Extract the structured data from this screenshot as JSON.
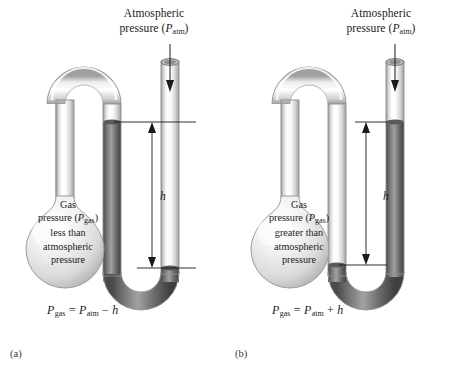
{
  "figure": {
    "background_color": "#ffffff",
    "mercury_color": "#6f6f6f",
    "glass_color": "#d8d8d8",
    "line_color": "#1a1a1a"
  },
  "panels": [
    {
      "caption": "(a)",
      "atmospheric": {
        "line1": "Atmospheric",
        "line2_prefix": "pressure (",
        "line2_symbol": "P",
        "line2_subscript": "atm",
        "line2_suffix": ")"
      },
      "bulb": {
        "line1": "Gas",
        "line2_prefix": "pressure (",
        "line2_symbol": "P",
        "line2_subscript": "gas",
        "line2_suffix": ")",
        "line3": "less than",
        "line4": "atmospheric",
        "line5": "pressure"
      },
      "height_label": "h",
      "equation": {
        "lhs_symbol": "P",
        "lhs_subscript": "gas",
        "equals": "=",
        "rhs_symbol": "P",
        "rhs_subscript": "atm",
        "operator": "−",
        "term": "h",
        "full": "Pgas = Patm − h"
      }
    },
    {
      "caption": "(b)",
      "atmospheric": {
        "line1": "Atmospheric",
        "line2_prefix": "pressure (",
        "line2_symbol": "P",
        "line2_subscript": "atm",
        "line2_suffix": ")"
      },
      "bulb": {
        "line1": "Gas",
        "line2_prefix": "pressure (",
        "line2_symbol": "P",
        "line2_subscript": "gas",
        "line2_suffix": ")",
        "line3": "greater than",
        "line4": "atmospheric",
        "line5": "pressure"
      },
      "height_label": "h",
      "equation": {
        "lhs_symbol": "P",
        "lhs_subscript": "gas",
        "equals": "=",
        "rhs_symbol": "P",
        "rhs_subscript": "atm",
        "operator": "+",
        "term": "h",
        "full": "Pgas = Patm + h"
      }
    }
  ]
}
